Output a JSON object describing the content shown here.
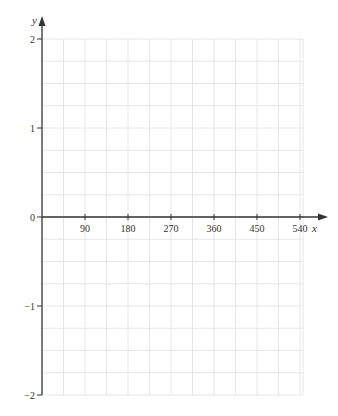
{
  "chart_data": {
    "type": "line",
    "title": "",
    "xlabel": "x",
    "ylabel": "y",
    "xlim": [
      0,
      540
    ],
    "ylim": [
      -2,
      2
    ],
    "x_ticks": [
      90,
      180,
      270,
      360,
      450,
      540
    ],
    "x_tick_labels": [
      "90",
      "180",
      "270",
      "360",
      "450",
      "540"
    ],
    "y_ticks": [
      2,
      1,
      0,
      -1,
      -2
    ],
    "y_tick_labels": [
      "2",
      "1",
      "0",
      "−1",
      "−2"
    ],
    "grid": true,
    "grid_minor_x_step": 45,
    "grid_minor_y_step": 0.25,
    "series": [],
    "legend": null
  },
  "colors": {
    "axis": "#333333",
    "grid": "#e6e6e6"
  }
}
